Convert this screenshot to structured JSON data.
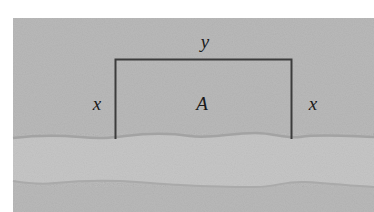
{
  "diagram": {
    "labels": {
      "top": "y",
      "left": "x",
      "right": "x",
      "area": "A"
    },
    "colors": {
      "page": "#ffffff",
      "land": "#b9b9b9",
      "river": "#c6c6c6",
      "riverbank": "#a3a3a3",
      "fence": "#3c3c3c",
      "text": "#1a1a1a"
    }
  }
}
